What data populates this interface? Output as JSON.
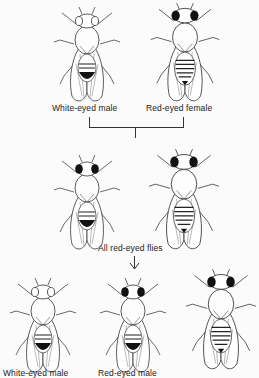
{
  "diagram": {
    "parents": {
      "left_label": "White-eyed male",
      "right_label": "Red-eyed female"
    },
    "f1": {
      "label": "All red-eyed flies"
    },
    "f2": {
      "left_label": "White-eyed male",
      "middle_label": "Red-eyed male",
      "right_label": ""
    },
    "colors": {
      "background": "#fbfbfb",
      "ink": "#1a1a1a",
      "eye_dark": "#111111"
    }
  }
}
